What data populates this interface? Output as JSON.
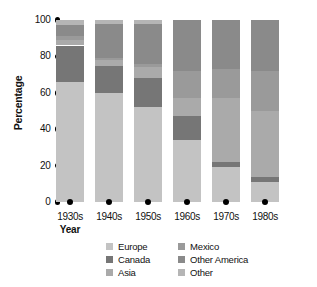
{
  "chart_data": {
    "type": "bar",
    "title": "",
    "subtitle": "",
    "xlabel": "Year",
    "ylabel": "Percentage",
    "stacked": true,
    "stack_mode": "percent",
    "grid": false,
    "legend_position": "bottom",
    "ylim": [
      0,
      100
    ],
    "ytick_labels": [
      "100",
      "80",
      "60",
      "40",
      "20",
      "0"
    ],
    "ytick_values": [
      100,
      80,
      60,
      40,
      20,
      0
    ],
    "categories": [
      "1930s",
      "1940s",
      "1950s",
      "1960s",
      "1970s",
      "1980s"
    ],
    "series": [
      {
        "name": "Europe",
        "color": "#c3c3c3",
        "values": [
          66,
          60,
          52,
          34,
          19,
          11
        ]
      },
      {
        "name": "Canada",
        "color": "#767676",
        "values": [
          20,
          15,
          16,
          13,
          3,
          3
        ]
      },
      {
        "name": "Asia",
        "color": "#aaaaaa",
        "values": [
          3,
          3,
          6,
          10,
          35,
          36
        ]
      },
      {
        "name": "Mexico",
        "color": "#9a9a9a",
        "values": [
          2,
          1,
          2,
          15,
          16,
          22
        ]
      },
      {
        "name": "Other America",
        "color": "#8a8a8a",
        "values": [
          6,
          19,
          22,
          28,
          27,
          28
        ]
      },
      {
        "name": "Other",
        "color": "#b5b5b5",
        "values": [
          3,
          2,
          2,
          0,
          0,
          0
        ]
      }
    ]
  },
  "legend": {
    "columns": [
      {
        "items": [
          {
            "label": "Europe",
            "swatch_name": "legend-swatch-europe",
            "color": "#c3c3c3"
          },
          {
            "label": "Canada",
            "swatch_name": "legend-swatch-canada",
            "color": "#767676"
          },
          {
            "label": "Asia",
            "swatch_name": "legend-swatch-asia",
            "color": "#aaaaaa"
          }
        ]
      },
      {
        "items": [
          {
            "label": "Mexico",
            "swatch_name": "legend-swatch-mexico",
            "color": "#9a9a9a"
          },
          {
            "label": "Other America",
            "swatch_name": "legend-swatch-other-america",
            "color": "#8a8a8a"
          },
          {
            "label": "Other",
            "swatch_name": "legend-swatch-other",
            "color": "#b5b5b5"
          }
        ]
      }
    ]
  }
}
